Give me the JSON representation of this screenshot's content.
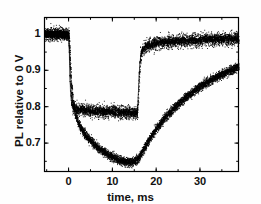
{
  "chart_data": {
    "type": "line",
    "title": "",
    "xlabel": "time, ms",
    "ylabel": "PL relative to 0 V",
    "xlim": [
      -5.5,
      38.8
    ],
    "ylim": [
      0.622,
      1.045
    ],
    "xticks": [
      0,
      10,
      20,
      30
    ],
    "xtick_labels": [
      "0",
      "10",
      "20",
      "30"
    ],
    "xminor_step": 5,
    "yticks": [
      0.7,
      0.8,
      0.9,
      1.0
    ],
    "ytick_labels": [
      "0.7",
      "0.8",
      "0.9",
      "1"
    ],
    "yminor_step": 0.05,
    "grid": false,
    "legend": null,
    "marker": "dot",
    "noise_amplitude_upper": 0.016,
    "noise_amplitude_lower": 0.012,
    "color": "#000000",
    "series": [
      {
        "name": "upper-trace-square-response",
        "description": "fast square PL quench, plateau near 0.79",
        "x": [
          -5.5,
          -4.5,
          -3.5,
          -2.5,
          -1.5,
          -0.8,
          -0.3,
          0.0,
          0.15,
          0.3,
          0.5,
          0.8,
          1.2,
          1.8,
          2.5,
          3.5,
          4.5,
          5.5,
          6.5,
          7.5,
          8.5,
          9.5,
          10.5,
          11.5,
          12.5,
          13.5,
          14.5,
          15.3,
          15.7,
          15.9,
          16.1,
          16.4,
          16.8,
          17.3,
          18.0,
          19.0,
          20.0,
          21.5,
          23.0,
          25.0,
          27.0,
          29.0,
          31.0,
          33.0,
          35.0,
          37.0,
          38.5
        ],
        "y": [
          0.999,
          1.0,
          0.998,
          1.0,
          0.999,
          1.0,
          0.998,
          0.999,
          0.96,
          0.885,
          0.832,
          0.806,
          0.797,
          0.793,
          0.791,
          0.79,
          0.789,
          0.788,
          0.788,
          0.787,
          0.787,
          0.786,
          0.786,
          0.785,
          0.784,
          0.784,
          0.783,
          0.783,
          0.782,
          0.82,
          0.89,
          0.935,
          0.955,
          0.963,
          0.968,
          0.972,
          0.975,
          0.977,
          0.979,
          0.981,
          0.982,
          0.983,
          0.984,
          0.985,
          0.986,
          0.986,
          0.987
        ]
      },
      {
        "name": "lower-trace-slow-response",
        "description": "slow PL quench to minimum 0.648 then slow recovery to 0.91",
        "x": [
          -5.5,
          -4.5,
          -3.5,
          -2.5,
          -1.5,
          -0.8,
          -0.3,
          0.0,
          0.3,
          0.6,
          1.0,
          1.5,
          2.0,
          2.6,
          3.2,
          4.0,
          5.0,
          6.0,
          7.0,
          8.0,
          9.0,
          10.0,
          11.0,
          12.0,
          13.0,
          14.0,
          15.0,
          15.7,
          16.2,
          17.0,
          18.0,
          19.0,
          20.0,
          21.5,
          23.0,
          24.5,
          26.0,
          27.5,
          29.0,
          30.5,
          32.0,
          33.5,
          35.0,
          36.5,
          38.0,
          38.6
        ],
        "y": [
          0.999,
          1.0,
          0.999,
          1.0,
          0.998,
          0.999,
          0.998,
          0.997,
          0.93,
          0.862,
          0.812,
          0.781,
          0.762,
          0.745,
          0.733,
          0.72,
          0.706,
          0.694,
          0.684,
          0.676,
          0.668,
          0.662,
          0.656,
          0.651,
          0.648,
          0.647,
          0.65,
          0.655,
          0.664,
          0.681,
          0.702,
          0.722,
          0.74,
          0.763,
          0.783,
          0.801,
          0.818,
          0.833,
          0.847,
          0.859,
          0.87,
          0.88,
          0.889,
          0.898,
          0.906,
          0.91
        ]
      }
    ]
  }
}
